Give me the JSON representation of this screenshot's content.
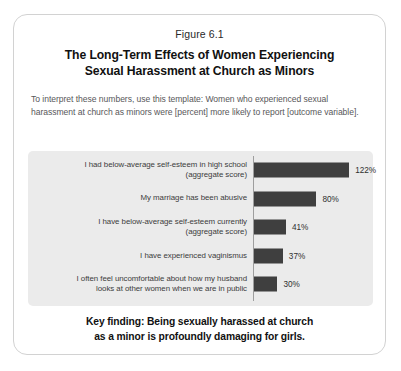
{
  "figure": {
    "number": "Figure 6.1",
    "title_line1": "The Long-Term Effects of Women Experiencing",
    "title_line2": "Sexual Harassment at Church as Minors",
    "description": "To interpret these numbers, use this template: Women who experienced sexual harassment at church as minors were [percent] more likely to report [outcome variable].",
    "key_finding_line1": "Key finding: Being sexually harassed at church",
    "key_finding_line2": "as a minor is profoundly damaging for girls."
  },
  "chart_data": {
    "type": "bar",
    "orientation": "horizontal",
    "title": "The Long-Term Effects of Women Experiencing Sexual Harassment at Church as Minors",
    "xlabel": "",
    "ylabel": "",
    "xlim": [
      0,
      130
    ],
    "grid": false,
    "legend": false,
    "bar_color": "#3f3f3f",
    "panel_color": "#ebebeb",
    "categories": [
      "I had below-average self-esteem in high school (aggregate score)",
      "My marriage has been abusive",
      "I have below-average self-esteem currently (aggregate score)",
      "I have experienced vaginismus",
      "I often feel uncomfortable about how my husband looks at other women when we are in public"
    ],
    "category_lines": [
      [
        "I had below-average self-esteem in high school",
        "(aggregate score)"
      ],
      [
        "My marriage has been abusive",
        ""
      ],
      [
        "I have below-average self-esteem currently",
        "(aggregate score)"
      ],
      [
        "I have experienced vaginismus",
        ""
      ],
      [
        "I often feel uncomfortable about how my husband",
        "looks at other women when we are in public"
      ]
    ],
    "values": [
      122,
      80,
      41,
      37,
      30
    ],
    "value_labels": [
      "122%",
      "80%",
      "41%",
      "37%",
      "30%"
    ]
  }
}
